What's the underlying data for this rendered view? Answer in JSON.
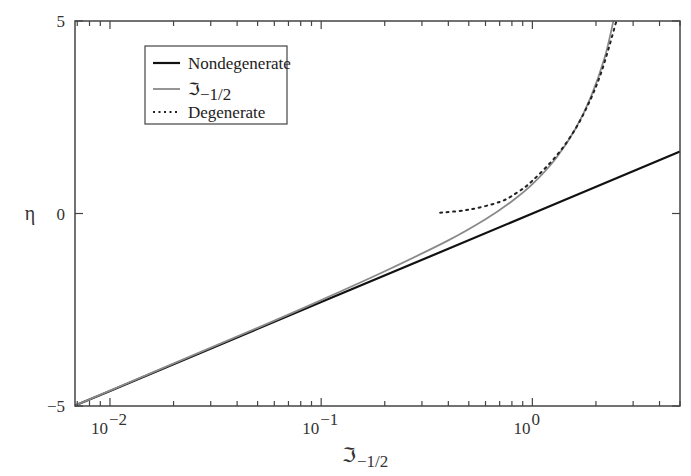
{
  "chart_data": {
    "type": "line",
    "title": "",
    "xlabel": "ℑ₋₁₂",
    "xlabel_main": "ℑ",
    "xlabel_sub": "−1/2",
    "ylabel": "η",
    "xscale": "log",
    "xlim": [
      0.00683,
      5.0
    ],
    "ylim": [
      -5,
      5
    ],
    "grid": false,
    "legend_position": "upper left",
    "x_ticks": [
      {
        "value": 0.01,
        "base": "10",
        "exp": "−2"
      },
      {
        "value": 0.1,
        "base": "10",
        "exp": "−1"
      },
      {
        "value": 1,
        "base": "10",
        "exp": "0"
      }
    ],
    "y_ticks": [
      {
        "value": -5,
        "label": "−5"
      },
      {
        "value": 0,
        "label": "0"
      },
      {
        "value": 5,
        "label": "5"
      }
    ],
    "series": [
      {
        "name": "Nondegenerate",
        "style": "solid-black",
        "color": "#111111",
        "x": [
          0.00683,
          0.01,
          0.1,
          1.0,
          5.0
        ],
        "y": [
          -4.99,
          -4.61,
          -2.3,
          0.0,
          1.61
        ]
      },
      {
        "name": "ℑ₋₁₂",
        "style": "solid-gray",
        "color": "#8a8a8a",
        "x": [
          0.00683,
          0.01,
          0.05,
          0.1,
          0.2,
          0.4,
          0.6,
          0.8,
          1.0,
          1.3,
          1.6,
          1.9,
          2.2,
          2.42
        ],
        "y": [
          -4.99,
          -4.6,
          -2.97,
          -2.25,
          -1.5,
          -0.7,
          -0.15,
          0.32,
          0.76,
          1.45,
          2.2,
          3.05,
          4.05,
          5.0
        ]
      },
      {
        "name": "Degenerate",
        "style": "dotted-black",
        "color": "#222222",
        "x": [
          0.366,
          0.5,
          0.7,
          0.85,
          1.0,
          1.3,
          1.6,
          1.88,
          2.1,
          2.3,
          2.5
        ],
        "y": [
          0.02,
          0.1,
          0.3,
          0.55,
          0.85,
          1.5,
          2.2,
          2.95,
          3.6,
          4.3,
          5.0
        ]
      }
    ]
  },
  "legend": {
    "items": [
      {
        "label": "Nondegenerate"
      },
      {
        "label_main": "ℑ",
        "label_sub": "−1/2"
      },
      {
        "label": "Degenerate"
      }
    ]
  },
  "colors": {
    "axis": "#444444",
    "nondegenerate": "#111111",
    "fermi": "#8a8a8a",
    "degenerate": "#222222"
  }
}
